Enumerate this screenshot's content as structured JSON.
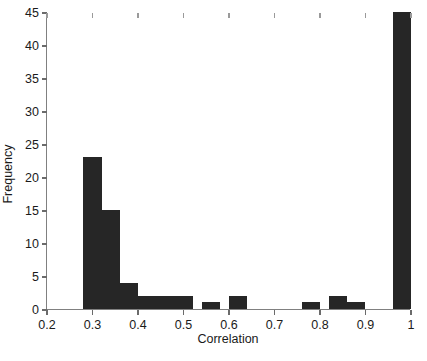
{
  "chart_data": {
    "type": "bar",
    "title": "",
    "subtitle": "",
    "xlabel": "Correlation",
    "ylabel": "Frequency",
    "xlim": [
      0.2,
      1.0
    ],
    "ylim": [
      0,
      45
    ],
    "grid": false,
    "legend": null,
    "xticks": [
      0.2,
      0.3,
      0.4,
      0.5,
      0.6,
      0.7,
      0.8,
      0.9,
      1.0
    ],
    "xtick_labels": [
      "0.2",
      "0.3",
      "0.4",
      "0.5",
      "0.6",
      "0.7",
      "0.8",
      "0.9",
      "1"
    ],
    "yticks": [
      0,
      5,
      10,
      15,
      20,
      25,
      30,
      35,
      40,
      45
    ],
    "ytick_labels": [
      "0",
      "5",
      "10",
      "15",
      "20",
      "25",
      "30",
      "35",
      "40",
      "45"
    ],
    "bar_color": "#262626",
    "axis_color": "#808080",
    "bin_width": 0.04,
    "bins": [
      {
        "left": 0.28,
        "right": 0.32,
        "value": 23
      },
      {
        "left": 0.32,
        "right": 0.36,
        "value": 15
      },
      {
        "left": 0.36,
        "right": 0.4,
        "value": 4
      },
      {
        "left": 0.4,
        "right": 0.44,
        "value": 2
      },
      {
        "left": 0.44,
        "right": 0.48,
        "value": 2
      },
      {
        "left": 0.48,
        "right": 0.52,
        "value": 2
      },
      {
        "left": 0.54,
        "right": 0.58,
        "value": 1
      },
      {
        "left": 0.6,
        "right": 0.64,
        "value": 2
      },
      {
        "left": 0.76,
        "right": 0.8,
        "value": 1
      },
      {
        "left": 0.82,
        "right": 0.86,
        "value": 2
      },
      {
        "left": 0.86,
        "right": 0.9,
        "value": 1
      },
      {
        "left": 0.96,
        "right": 1.0,
        "value": 45
      }
    ]
  }
}
